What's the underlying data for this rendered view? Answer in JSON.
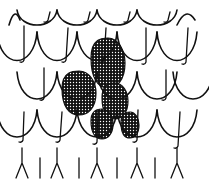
{
  "illustration": {
    "subject": "scale-pattern-drawing",
    "width": 209,
    "height": 186,
    "ink_color": "#111111",
    "background_color": "#ffffff",
    "stipple_color": "#111111",
    "rows": [
      {
        "name": "row-1",
        "bottom_y": 32,
        "top_y": 10,
        "peaks_x": [
          17,
          57,
          97,
          137,
          177
        ],
        "arc_centers_x": [
          37,
          77,
          117,
          157
        ],
        "edge_arcs": [
          [
            9,
            20
          ],
          [
            177,
            195
          ]
        ],
        "ticks": [
          [
            50,
            12,
            48,
            20
          ],
          [
            90,
            12,
            88,
            20
          ],
          [
            130,
            12,
            128,
            20
          ],
          [
            170,
            12,
            168,
            20
          ]
        ]
      },
      {
        "name": "row-2",
        "bottom_y": 72,
        "top_y": 32,
        "peaks_x": [
          37,
          77,
          117,
          157
        ],
        "arc_centers_x": [
          17,
          57,
          97,
          137,
          177
        ],
        "ticks": [
          [
            24,
            26,
            24,
            60
          ],
          [
            68,
            28,
            66,
            60
          ],
          [
            106,
            28,
            104,
            60
          ],
          [
            146,
            28,
            146,
            62
          ],
          [
            188,
            28,
            186,
            62
          ]
        ]
      },
      {
        "name": "row-3",
        "bottom_y": 110,
        "top_y": 72,
        "peaks_x": [
          17,
          57,
          97,
          137,
          177
        ],
        "arc_centers_x": [
          37,
          77,
          117,
          157,
          193
        ],
        "ticks": [
          [
            44,
            68,
            44,
            98
          ],
          [
            166,
            70,
            166,
            98
          ]
        ]
      },
      {
        "name": "row-4",
        "bottom_y": 148,
        "top_y": 110,
        "peaks_x": [
          37,
          77,
          117,
          157
        ],
        "arc_centers_x": [
          17,
          57,
          97,
          137,
          177
        ],
        "ticks": [
          [
            24,
            112,
            23,
            140
          ],
          [
            62,
            112,
            60,
            140
          ],
          [
            98,
            112,
            97,
            142
          ],
          [
            138,
            110,
            137,
            140
          ],
          [
            180,
            112,
            178,
            146
          ]
        ]
      },
      {
        "name": "row-5-forks",
        "forks_x": [
          22,
          57,
          97,
          137,
          177
        ],
        "sticks_x": [
          40,
          79,
          117,
          155
        ],
        "top_y": 148,
        "bottom_y": 178
      }
    ],
    "shaded_scales": [
      {
        "name": "shaded-scale-top",
        "cx": 108,
        "cy": 63,
        "rx": 17,
        "ry": 25
      },
      {
        "name": "shaded-scale-left",
        "cx": 79,
        "cy": 93,
        "rx": 17,
        "ry": 22
      },
      {
        "name": "shaded-scale-right",
        "cx": 115,
        "cy": 101,
        "rx": 13,
        "ry": 18
      },
      {
        "name": "shaded-scale-bottom-left",
        "cx": 102,
        "cy": 124,
        "rx": 11,
        "ry": 15
      },
      {
        "name": "shaded-scale-bottom-right",
        "cx": 130,
        "cy": 125,
        "rx": 9,
        "ry": 13
      }
    ]
  }
}
